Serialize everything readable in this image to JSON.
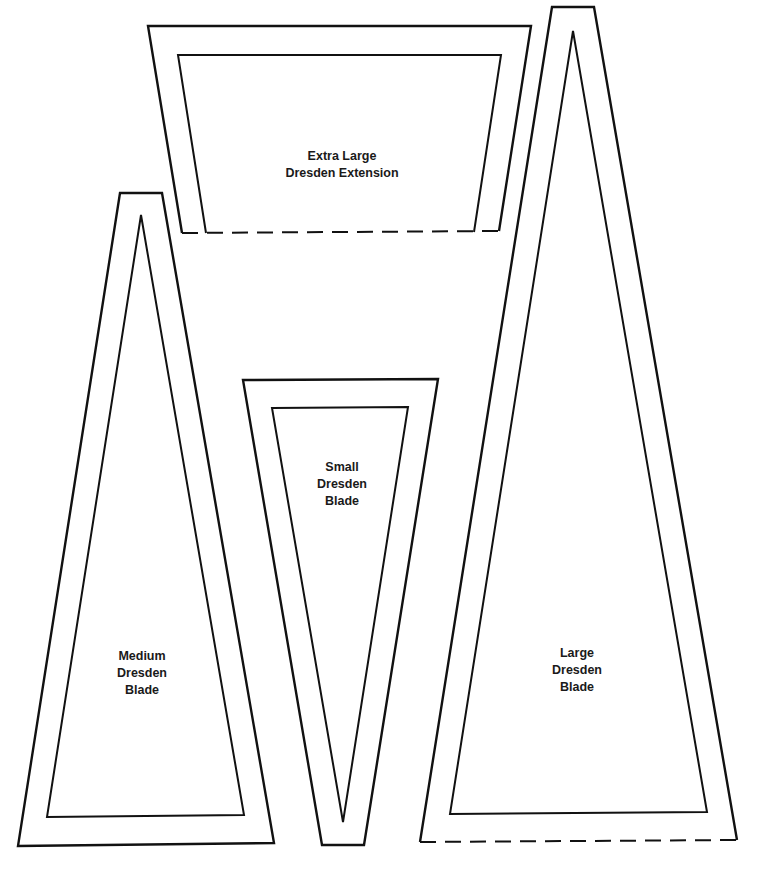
{
  "page": {
    "background": "#ffffff",
    "line_color": "#111111"
  },
  "templates": [
    {
      "id": "extra-large-extension",
      "label_lines": [
        "Extra Large",
        "Dresden Extension"
      ],
      "bottom_edge": "dashed"
    },
    {
      "id": "medium-blade",
      "label_lines": [
        "Medium",
        "Dresden",
        "Blade"
      ],
      "bottom_edge": "solid"
    },
    {
      "id": "small-blade",
      "label_lines": [
        "Small",
        "Dresden",
        "Blade"
      ],
      "bottom_edge": "solid"
    },
    {
      "id": "large-blade",
      "label_lines": [
        "Large",
        "Dresden",
        "Blade"
      ],
      "bottom_edge": "dashed"
    }
  ]
}
